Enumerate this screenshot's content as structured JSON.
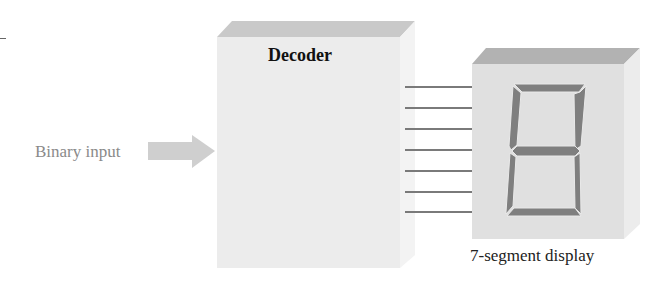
{
  "diagram": {
    "decoder": {
      "title": "Decoder",
      "front_color": "#ececec",
      "top_color": "#c9c9c9",
      "side_color": "#f3f3f3"
    },
    "input": {
      "label": "Binary input",
      "arrow_color": "#cfcfcf"
    },
    "outputs": {
      "line_count": 7,
      "line_color": "#7a7a7a"
    },
    "display": {
      "label": "7-segment display",
      "front_color": "#e0e0e0",
      "top_color": "#b2b2b2",
      "side_color": "#ececec",
      "segment_color": "#7f7f7f",
      "digit_shown": "8"
    }
  }
}
